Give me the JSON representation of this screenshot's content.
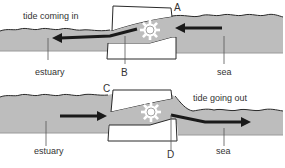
{
  "diagram": {
    "type": "tidal-barrage",
    "colors": {
      "water": "#bdbdbd",
      "outline": "#2a2a2a",
      "arrow": "#1a1a1a",
      "block": "#ffffff",
      "text": "#333333"
    },
    "panels": [
      {
        "id": "top",
        "caption": "tide coming in",
        "left_label": "estuary",
        "right_label": "sea",
        "letter_top": "A",
        "letter_bottom": "B",
        "flow_direction": "sea-to-estuary",
        "icons": [
          "turbine-gear-icon",
          "arrow-left-icon",
          "arrow-left-icon"
        ]
      },
      {
        "id": "bottom",
        "caption": "tide going out",
        "left_label": "estuary",
        "right_label": "sea",
        "letter_top": "C",
        "letter_bottom": "D",
        "flow_direction": "estuary-to-sea",
        "icons": [
          "turbine-gear-icon",
          "arrow-right-icon",
          "arrow-right-icon"
        ]
      }
    ]
  }
}
